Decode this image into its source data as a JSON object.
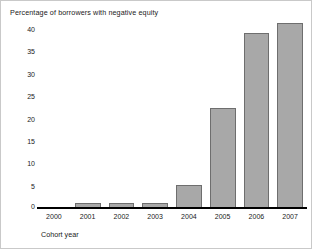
{
  "chart_data": {
    "type": "bar",
    "title": "Percentage of borrowers with negative equity",
    "xlabel": "Cohort year",
    "ylabel": "",
    "categories": [
      "2000",
      "2001",
      "2002",
      "2003",
      "2004",
      "2005",
      "2006",
      "2007"
    ],
    "values": [
      0,
      1,
      1,
      1,
      5,
      21.5,
      37.5,
      39.5
    ],
    "yticks": [
      "40",
      "35",
      "30",
      "25",
      "20",
      "15",
      "10",
      "5",
      "0"
    ],
    "ytick_values": [
      40,
      35,
      30,
      25,
      20,
      15,
      10,
      5,
      0
    ],
    "ylim": [
      0,
      40
    ],
    "grid": false,
    "legend": false,
    "bar_fill": "#a8a8a8",
    "bar_edge": "#6e6e6e",
    "axis_color": "#000000"
  }
}
